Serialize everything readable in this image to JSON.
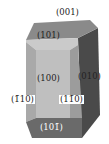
{
  "diagram": {
    "labels": {
      "top": "(001)",
      "upper_front": "(101)",
      "front": "(100)",
      "right": "(010)",
      "left_side": "(1̄10)",
      "right_side": "(11̄0)",
      "bottom": "(101̄)"
    },
    "colors": {
      "top": "#8a8a8a",
      "upper_front": "#c8c8c8",
      "front": "#bdbdbd",
      "left_side": "#a8a8a8",
      "right_side": "#9a9a9a",
      "right": "#4a4a4a",
      "bottom": "#6a6a6a"
    }
  }
}
